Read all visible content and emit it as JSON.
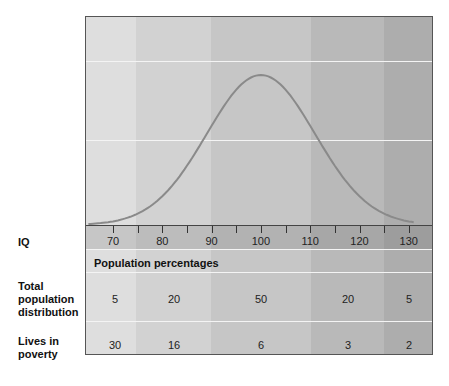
{
  "chart_data": {
    "type": "area",
    "title": "",
    "xlabel": "IQ",
    "ylabel": "",
    "x_ticks": [
      70,
      80,
      90,
      100,
      110,
      120,
      130
    ],
    "xlim": [
      64.5,
      135
    ],
    "curve": "normal distribution, mean 100, sd 15",
    "grid": true,
    "bands": [
      {
        "range": "<75",
        "total_population_distribution": 5,
        "lives_in_poverty": 30
      },
      {
        "range": "75-90",
        "total_population_distribution": 20,
        "lives_in_poverty": 16
      },
      {
        "range": "90-110",
        "total_population_distribution": 50,
        "lives_in_poverty": 6
      },
      {
        "range": "110-125",
        "total_population_distribution": 20,
        "lives_in_poverty": 3
      },
      {
        "range": ">125",
        "total_population_distribution": 5,
        "lives_in_poverty": 2
      }
    ],
    "table_header": "Population percentages",
    "rows": [
      {
        "label": "Total population distribution",
        "values": [
          5,
          20,
          50,
          20,
          5
        ]
      },
      {
        "label": "Lives in poverty",
        "values": [
          30,
          16,
          6,
          3,
          2
        ]
      }
    ]
  },
  "labels": {
    "iq": "IQ",
    "pop_header": "Population percentages",
    "row1_a": "Total",
    "row1_b": "population",
    "row1_c": "distribution",
    "row2_a": "Lives in",
    "row2_b": "poverty"
  },
  "ticks": [
    "70",
    "80",
    "90",
    "100",
    "110",
    "120",
    "130"
  ],
  "row1": [
    "5",
    "20",
    "50",
    "20",
    "5"
  ],
  "row2": [
    "30",
    "16",
    "6",
    "3",
    "2"
  ],
  "colors": {
    "band1": "#dedede",
    "band2": "#d2d2d2",
    "band3": "#c6c6c6",
    "band4": "#b9b9b9",
    "band5": "#adadad",
    "curve": "#8a8a8a"
  }
}
